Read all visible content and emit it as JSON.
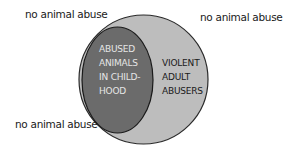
{
  "diagram": {
    "type": "venn-nested",
    "outer_set": {
      "label_lines": [
        "VIOLENT",
        "ADULT",
        "ABUSERS"
      ],
      "fill": "#bdbdbd",
      "stroke": "#2a2a2a"
    },
    "inner_set": {
      "label_lines": [
        "ABUSED",
        "ANIMALS",
        "IN CHILD-",
        "HOOD"
      ],
      "fill": "#6b6b6b",
      "stroke": "#1a1a1a"
    },
    "outside_labels": {
      "top_left": "no animal abuse",
      "top_right": "no animal abuse",
      "bottom_left": "no animal abuse"
    }
  }
}
